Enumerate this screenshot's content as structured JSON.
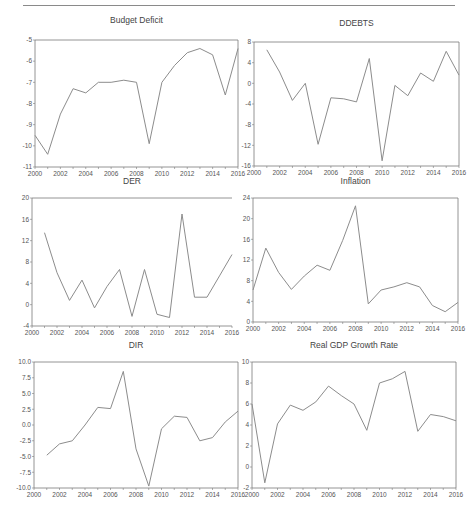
{
  "figure": {
    "background": "#ffffff",
    "line_color": "#8c8c8c",
    "axis_color": "#7a7a7a"
  },
  "chart_data": [
    {
      "type": "line",
      "title": "Budget Deficit",
      "xlabel": "",
      "ylabel": "",
      "x": [
        2000,
        2001,
        2002,
        2003,
        2004,
        2005,
        2006,
        2007,
        2008,
        2009,
        2010,
        2011,
        2012,
        2013,
        2014,
        2015,
        2016
      ],
      "values": [
        -9.5,
        -10.4,
        -8.5,
        -7.3,
        -7.5,
        -7.0,
        -7.0,
        -6.9,
        -7.0,
        -9.9,
        -7.0,
        -6.2,
        -5.6,
        -5.4,
        -5.7,
        -7.6,
        -5.4
      ],
      "xlim": [
        2000,
        2016
      ],
      "ylim": [
        -11,
        -5
      ],
      "yticks": [
        -5,
        -6,
        -7,
        -8,
        -9,
        -10,
        -11
      ],
      "xticks": [
        2000,
        2002,
        2004,
        2006,
        2008,
        2010,
        2012,
        2014,
        2016
      ],
      "ytick_labels": [
        "-5",
        "-6",
        "-7",
        "-8",
        "-9",
        "-10",
        "-11"
      ],
      "xtick_labels": [
        "2000",
        "2002",
        "2004",
        "2006",
        "2008",
        "2010",
        "2012",
        "2014",
        "2016"
      ],
      "grid": false,
      "legend": "none"
    },
    {
      "type": "line",
      "title": "DDEBTS",
      "xlabel": "",
      "ylabel": "",
      "x": [
        2001,
        2002,
        2003,
        2004,
        2005,
        2006,
        2007,
        2008,
        2009,
        2010,
        2011,
        2012,
        2013,
        2014,
        2015,
        2016
      ],
      "values": [
        6.5,
        2.2,
        -3.3,
        0.0,
        -11.8,
        -2.8,
        -3.0,
        -3.6,
        4.8,
        -15.0,
        -0.4,
        -2.4,
        2.0,
        0.4,
        6.2,
        1.6
      ],
      "xlim": [
        2000,
        2016
      ],
      "ylim": [
        -16,
        8
      ],
      "yticks": [
        8,
        4,
        0,
        -4,
        -8,
        -12,
        -16
      ],
      "xticks": [
        2000,
        2002,
        2004,
        2006,
        2008,
        2010,
        2012,
        2014,
        2016
      ],
      "ytick_labels": [
        "8",
        "4",
        "0",
        "-4",
        "-8",
        "-12",
        "-16"
      ],
      "xtick_labels": [
        "2000",
        "2002",
        "2004",
        "2006",
        "2008",
        "2010",
        "2012",
        "2014",
        "2016"
      ],
      "grid": false,
      "legend": "none"
    },
    {
      "type": "line",
      "title": "DER",
      "xlabel": "",
      "ylabel": "",
      "x": [
        2001,
        2002,
        2003,
        2004,
        2005,
        2006,
        2007,
        2008,
        2009,
        2010,
        2011,
        2012,
        2013,
        2014,
        2015,
        2016
      ],
      "values": [
        13.5,
        6.0,
        0.8,
        4.6,
        -0.6,
        3.4,
        6.6,
        -2.2,
        6.6,
        -1.8,
        -2.4,
        17.0,
        1.4,
        1.4,
        5.4,
        9.4
      ],
      "xlim": [
        2000,
        2016
      ],
      "ylim": [
        -4,
        20
      ],
      "yticks": [
        20,
        16,
        12,
        8,
        4,
        0,
        -4
      ],
      "xticks": [
        2000,
        2002,
        2004,
        2006,
        2008,
        2010,
        2012,
        2014,
        2016
      ],
      "ytick_labels": [
        "20",
        "16",
        "12",
        "8",
        "4",
        "0",
        "-4"
      ],
      "xtick_labels": [
        "2000",
        "2002",
        "2004",
        "2006",
        "2008",
        "2010",
        "2012",
        "2014",
        "2016"
      ],
      "grid": false,
      "legend": "none"
    },
    {
      "type": "line",
      "title": "Inflation",
      "xlabel": "",
      "ylabel": "",
      "x": [
        2000,
        2001,
        2002,
        2003,
        2004,
        2005,
        2006,
        2007,
        2008,
        2009,
        2010,
        2011,
        2012,
        2013,
        2014,
        2015,
        2016
      ],
      "values": [
        6.2,
        14.3,
        9.6,
        6.3,
        8.9,
        11.0,
        10.0,
        15.8,
        22.5,
        3.5,
        6.2,
        6.8,
        7.6,
        6.8,
        3.2,
        2.0,
        3.8
      ],
      "xlim": [
        2000,
        2016
      ],
      "ylim": [
        0,
        24
      ],
      "yticks": [
        24,
        20,
        16,
        12,
        8,
        4,
        0
      ],
      "xticks": [
        2000,
        2002,
        2004,
        2006,
        2008,
        2010,
        2012,
        2014,
        2016
      ],
      "ytick_labels": [
        "24",
        "20",
        "16",
        "12",
        "8",
        "4",
        "0"
      ],
      "xtick_labels": [
        "2000",
        "2002",
        "2004",
        "2006",
        "2008",
        "2010",
        "2012",
        "2014",
        "2016"
      ],
      "grid": false,
      "legend": "none"
    },
    {
      "type": "line",
      "title": "DIR",
      "xlabel": "",
      "ylabel": "",
      "x": [
        2001,
        2002,
        2003,
        2004,
        2005,
        2006,
        2007,
        2008,
        2009,
        2010,
        2011,
        2012,
        2013,
        2014,
        2015,
        2016
      ],
      "values": [
        -4.8,
        -3.0,
        -2.5,
        0.0,
        2.8,
        2.6,
        8.5,
        -3.8,
        -9.7,
        -0.6,
        1.4,
        1.2,
        -2.5,
        -2.0,
        0.5,
        2.2
      ],
      "xlim": [
        2000,
        2016
      ],
      "ylim": [
        -10,
        10
      ],
      "yticks": [
        10,
        7.5,
        5,
        2.5,
        0,
        -2.5,
        -5,
        -7.5,
        -10
      ],
      "xticks": [
        2000,
        2002,
        2004,
        2006,
        2008,
        2010,
        2012,
        2014,
        2016
      ],
      "ytick_labels": [
        "10.0",
        "7.5",
        "5.0",
        "2.5",
        "0.0",
        "-2.5",
        "-5.0",
        "-7.5",
        "-10.0"
      ],
      "xtick_labels": [
        "2000",
        "2002",
        "2004",
        "2006",
        "2008",
        "2010",
        "2012",
        "2014",
        "2016"
      ],
      "grid": false,
      "legend": "none"
    },
    {
      "type": "line",
      "title": "Real GDP Growth Rate",
      "xlabel": "",
      "ylabel": "",
      "x": [
        2000,
        2001,
        2002,
        2003,
        2004,
        2005,
        2006,
        2007,
        2008,
        2009,
        2010,
        2011,
        2012,
        2013,
        2014,
        2015,
        2016
      ],
      "values": [
        6.0,
        -1.5,
        4.1,
        5.9,
        5.4,
        6.2,
        7.7,
        6.8,
        6.0,
        3.5,
        8.0,
        8.4,
        9.1,
        3.4,
        5.0,
        4.8,
        4.4
      ],
      "xlim": [
        2000,
        2016
      ],
      "ylim": [
        -2,
        10
      ],
      "yticks": [
        10,
        8,
        6,
        4,
        2,
        0,
        -2
      ],
      "xticks": [
        2000,
        2002,
        2004,
        2006,
        2008,
        2010,
        2012,
        2014,
        2016
      ],
      "ytick_labels": [
        "10",
        "8",
        "6",
        "4",
        "2",
        "0",
        "-2"
      ],
      "xtick_labels": [
        "2000",
        "2002",
        "2004",
        "2006",
        "2008",
        "2010",
        "2012",
        "2014",
        "2016"
      ],
      "grid": false,
      "legend": "none"
    }
  ],
  "panels": [
    {
      "title": "Budget Deficit"
    },
    {
      "title": "DDEBTS"
    },
    {
      "title": "DER"
    },
    {
      "title": "Inflation"
    },
    {
      "title": "DIR"
    },
    {
      "title": "Real GDP Growth Rate"
    }
  ]
}
